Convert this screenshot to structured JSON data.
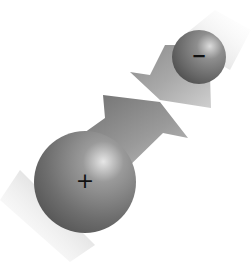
{
  "diagram": {
    "charges": [
      {
        "id": "positive",
        "sign": "+",
        "size": "large",
        "center": [
          85,
          182
        ],
        "radius": 51
      },
      {
        "id": "negative",
        "sign": "−",
        "size": "small",
        "center": [
          199,
          57
        ],
        "radius": 27
      }
    ],
    "arrows": [
      {
        "id": "arrow-from-positive",
        "direction": "toward negative charge (up-right)"
      },
      {
        "id": "arrow-from-negative",
        "direction": "toward positive charge (down-left)"
      }
    ],
    "colors": {
      "background": "#ffffff",
      "sphere_dark": "#5a5a5a",
      "sphere_mid": "#8a8a8a",
      "sphere_highlight": "#e8e8e8",
      "arrow_dark": "#6e6e6e",
      "arrow_light": "#c8c8c8",
      "label": "#111111"
    }
  }
}
